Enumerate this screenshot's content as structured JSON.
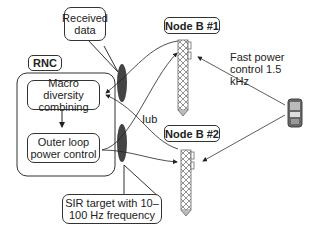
{
  "diagram": {
    "rnc_label": "RNC",
    "macro_diversity": "Macro diversity combining",
    "outer_loop": "Outer loop power control",
    "received_data": "Received data",
    "sir_target": "SIR target with 10–100 Hz frequency",
    "iub": "Iub",
    "node_b1": "Node B #1",
    "node_b2": "Node B #2",
    "fast_power": "Fast power control 1.5 kHz"
  },
  "colors": {
    "line": "#333333",
    "ellipse": "#444444",
    "tower": "#777777"
  }
}
